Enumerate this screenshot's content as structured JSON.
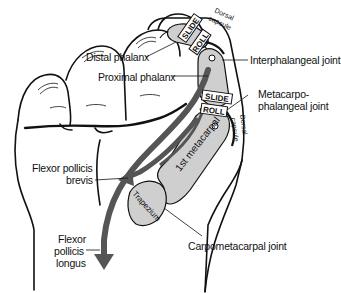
{
  "colors": {
    "outline": "#111111",
    "bone_fill": "#cfcfcf",
    "muscle_arrow": "#555555",
    "skin": "#ffffff"
  },
  "labels": {
    "distal_phalanx": "Distal phalanx",
    "proximal_phalanx": "Proximal phalanx",
    "interphalangeal_joint": "Interphalangeal joint",
    "metacarpophalangeal_joint_line1": "Metacarpo-",
    "metacarpophalangeal_joint_line2": "phalangeal joint",
    "flexor_pollicis_brevis_line1": "Flexor pollicis",
    "flexor_pollicis_brevis_line2": "brevis",
    "flexor_pollicis_longus_line1": "Flexor",
    "flexor_pollicis_longus_line2": "pollicis",
    "flexor_pollicis_longus_line3": "longus",
    "carpometacarpal_joint": "Carpometacarpal joint"
  },
  "bone_labels": {
    "first_metacarpal": "1st metacarpal",
    "trapezium": "Trapezium"
  },
  "capsule_labels": {
    "ip_dorsal_1": "Dorsal",
    "ip_capsule_1": "capsule",
    "mcp_dorsal_2": "Dorsal",
    "mcp_capsule_2": "capsule"
  },
  "motion_tags": {
    "ip_slide": "SLIDE",
    "ip_roll": "ROLL",
    "mcp_slide": "SLIDE",
    "mcp_roll": "ROLL"
  }
}
